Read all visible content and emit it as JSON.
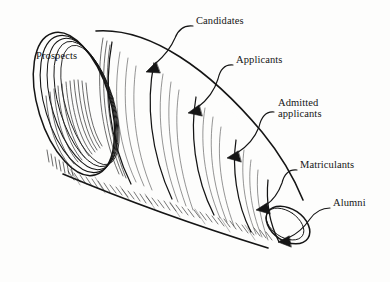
{
  "figure": {
    "style": "pen-and-ink line drawing",
    "background_color": "#fdfdfc",
    "ink_color": "#151515"
  },
  "labels": [
    {
      "id": "prospects",
      "text": "Prospects",
      "x": 36,
      "y": 56,
      "has_leader": false,
      "has_arrow": false
    },
    {
      "id": "candidates",
      "text": "Candidates",
      "x": 196,
      "y": 21,
      "has_leader": true,
      "has_arrow": true
    },
    {
      "id": "applicants",
      "text": "Applicants",
      "x": 236,
      "y": 60,
      "has_leader": true,
      "has_arrow": true
    },
    {
      "id": "admitted-applicants-line1",
      "text": "Admitted",
      "x": 278,
      "y": 103,
      "has_leader": true,
      "has_arrow": true
    },
    {
      "id": "admitted-applicants-line2",
      "text": "applicants",
      "x": 278,
      "y": 114,
      "has_leader": false,
      "has_arrow": false
    },
    {
      "id": "matriculants",
      "text": "Matriculants",
      "x": 300,
      "y": 165,
      "has_leader": true,
      "has_arrow": true
    },
    {
      "id": "alumni",
      "text": "Alumni",
      "x": 333,
      "y": 203,
      "has_leader": true,
      "has_arrow": true
    }
  ],
  "icons": {
    "arrowhead": "arrowhead-icon",
    "leader_line": "leader-line-icon",
    "cone": "cone-funnel-icon",
    "ellipse_mouth": "ellipse-opening-icon"
  },
  "stages_order": [
    "Prospects",
    "Candidates",
    "Applicants",
    "Admitted applicants",
    "Matriculants",
    "Alumni"
  ]
}
